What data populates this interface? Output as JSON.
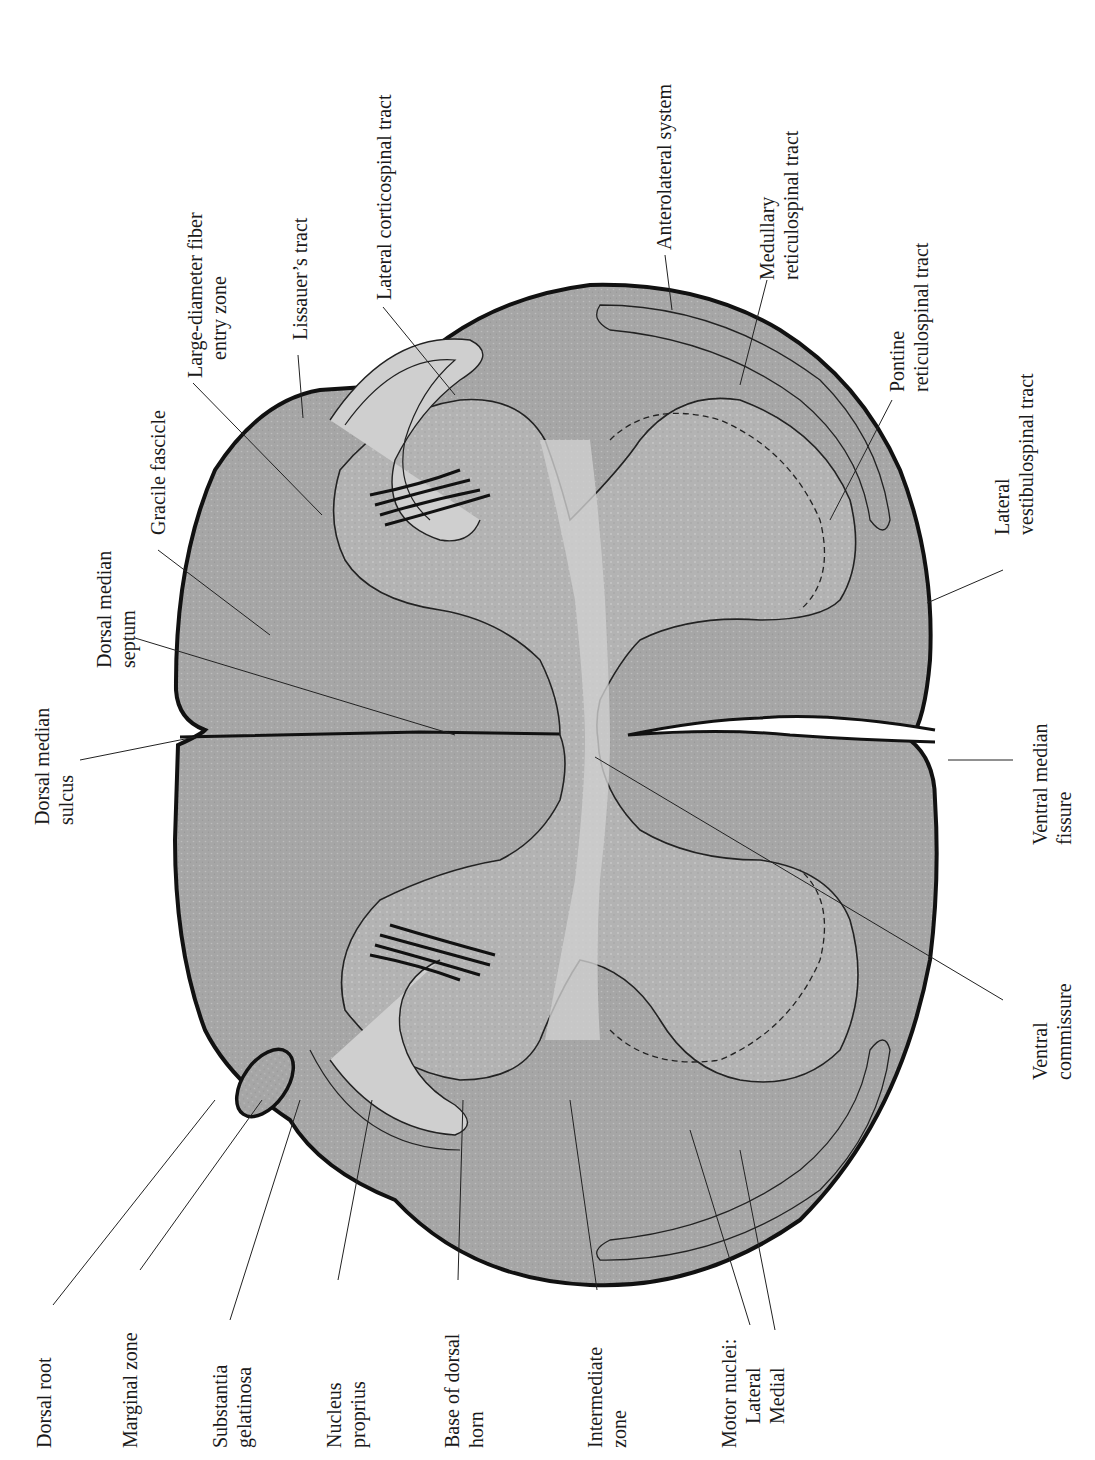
{
  "figure": {
    "colors": {
      "white_matter": "#a9a9a9",
      "gray_matter": "#b9b9b9",
      "outline": "#111111",
      "background": "#ffffff",
      "leader": "#222222"
    }
  },
  "labels": {
    "dorsal_root": [
      "Dorsal root"
    ],
    "marginal_zone": [
      "Marginal zone"
    ],
    "substantia_gelatinosa": [
      "Substantia",
      "gelatinosa"
    ],
    "nucleus_proprius": [
      "Nucleus",
      "proprius"
    ],
    "base_of_dorsal_horn": [
      "Base of dorsal",
      "horn"
    ],
    "intermediate_zone": [
      "Intermediate",
      "zone"
    ],
    "motor_nuclei": [
      "Motor nuclei:",
      "Lateral",
      "Medial"
    ],
    "dorsal_median_sulcus": [
      "Dorsal median",
      "sulcus"
    ],
    "dorsal_median_septum": [
      "Dorsal median",
      "septum"
    ],
    "gracile_fascicle": [
      "Gracile fascicle"
    ],
    "large_diameter_fiber_entry_zone": [
      "Large-diameter fiber",
      "entry zone"
    ],
    "lissauers_tract": [
      "Lissauer’s tract"
    ],
    "lateral_corticospinal_tract": [
      "Lateral corticospinal tract"
    ],
    "anterolateral_system": [
      "Anterolateral system"
    ],
    "medullary_reticulospinal_tract": [
      "Medullary",
      "reticulospinal tract"
    ],
    "pontine_reticulospinal_tract": [
      "Pontine",
      "reticulospinal tract"
    ],
    "lateral_vestibulospinal_tract": [
      "Lateral",
      "vestibulospinal tract"
    ],
    "ventral_median_fissure": [
      "Ventral median",
      "fissure"
    ],
    "ventral_commissure": [
      "Ventral",
      "commissure"
    ]
  }
}
